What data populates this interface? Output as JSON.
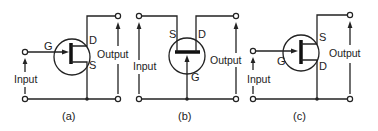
{
  "figure": {
    "panels": [
      {
        "id": "a",
        "caption": "(a)",
        "pins": {
          "gate": "G",
          "drain": "D",
          "source": "S"
        },
        "input_label": "Input",
        "output_label": "Output"
      },
      {
        "id": "b",
        "caption": "(b)",
        "pins": {
          "gate": "G",
          "drain": "D",
          "source": "S"
        },
        "input_label": "Input",
        "output_label": "Output"
      },
      {
        "id": "c",
        "caption": "(c)",
        "pins": {
          "gate": "G",
          "drain": "D",
          "source": "S"
        },
        "input_label": "Input",
        "output_label": "Output"
      }
    ]
  }
}
